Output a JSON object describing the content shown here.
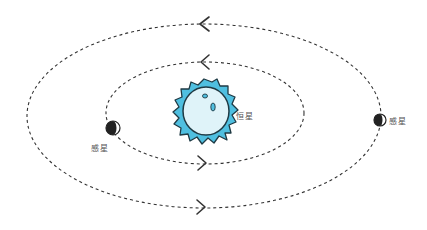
{
  "diagram": {
    "title": "",
    "star": {
      "label": "恒星",
      "fill": "#4fbfe0",
      "inner_fill": "#dff3f9",
      "stroke": "#1f3a44"
    },
    "planets": [
      {
        "label": "感星",
        "position": "left inner orbit"
      },
      {
        "label": "感星",
        "position": "right outer orbit"
      }
    ],
    "orbits": [
      {
        "name": "inner",
        "direction": "counterclockwise",
        "arrows": [
          "top: left-pointing",
          "bottom: right-pointing"
        ]
      },
      {
        "name": "outer",
        "direction": "counterclockwise",
        "arrows": [
          "top: left-pointing",
          "bottom: right-pointing"
        ]
      }
    ],
    "colors": {
      "orbit": "#333333",
      "planet_dark": "#222222",
      "planet_light": "#ffffff"
    }
  }
}
